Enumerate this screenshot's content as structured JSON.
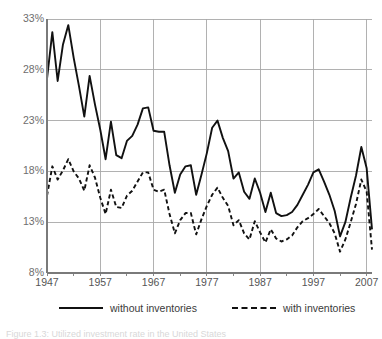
{
  "chart_data": {
    "type": "line",
    "title": "",
    "xlabel": "",
    "ylabel": "",
    "xlim": [
      1947,
      2008
    ],
    "ylim": [
      8,
      33
    ],
    "ytick_labels": [
      "33%",
      "28%",
      "23%",
      "18%",
      "13%",
      "8%"
    ],
    "ytick_values": [
      33,
      28,
      23,
      18,
      13,
      8
    ],
    "xtick_labels": [
      "1947",
      "1957",
      "1967",
      "1977",
      "1987",
      "1997",
      "2007"
    ],
    "xtick_values": [
      1947,
      1957,
      1967,
      1977,
      1987,
      1997,
      2007
    ],
    "grid": true,
    "legend_position": "bottom",
    "x": [
      1947,
      1948,
      1949,
      1950,
      1951,
      1952,
      1953,
      1954,
      1955,
      1956,
      1957,
      1958,
      1959,
      1960,
      1961,
      1962,
      1963,
      1964,
      1965,
      1966,
      1967,
      1968,
      1969,
      1970,
      1971,
      1972,
      1973,
      1974,
      1975,
      1976,
      1977,
      1978,
      1979,
      1980,
      1981,
      1982,
      1983,
      1984,
      1985,
      1986,
      1987,
      1988,
      1989,
      1990,
      1991,
      1992,
      1993,
      1994,
      1995,
      1996,
      1997,
      1998,
      1999,
      2000,
      2001,
      2002,
      2003,
      2004,
      2005,
      2006,
      2007,
      2008
    ],
    "series": [
      {
        "name": "without inventories",
        "style": "solid",
        "color": "#111111",
        "values": [
          27.1,
          31.7,
          26.9,
          30.5,
          32.4,
          29.2,
          26.4,
          23.4,
          27.4,
          24.6,
          22.1,
          19.2,
          22.9,
          19.6,
          19.3,
          21.0,
          21.5,
          22.6,
          24.2,
          24.3,
          22.0,
          21.9,
          21.9,
          18.6,
          15.9,
          17.7,
          18.5,
          18.6,
          15.7,
          17.7,
          19.8,
          22.3,
          23.0,
          21.3,
          20.0,
          17.3,
          17.9,
          16.0,
          15.3,
          17.3,
          15.9,
          14.0,
          15.9,
          13.9,
          13.6,
          13.7,
          14.0,
          14.7,
          15.7,
          16.7,
          17.9,
          18.2,
          17.0,
          15.7,
          14.1,
          11.6,
          13.0,
          15.4,
          17.6,
          20.4,
          18.3,
          12.3
        ]
      },
      {
        "name": "with inventories",
        "style": "dashed",
        "color": "#111111",
        "values": [
          15.6,
          18.5,
          17.2,
          18.1,
          19.2,
          18.0,
          17.3,
          16.1,
          18.6,
          17.4,
          15.4,
          13.8,
          16.2,
          14.5,
          14.4,
          15.6,
          16.1,
          17.0,
          17.9,
          17.9,
          16.2,
          16.0,
          16.2,
          13.8,
          11.9,
          13.2,
          13.9,
          13.9,
          11.8,
          13.3,
          14.6,
          15.7,
          16.4,
          15.4,
          14.6,
          12.7,
          13.2,
          11.9,
          11.3,
          13.1,
          12.0,
          11.0,
          12.3,
          11.4,
          11.1,
          11.3,
          11.7,
          12.5,
          13.1,
          13.4,
          13.8,
          14.3,
          13.6,
          12.9,
          11.9,
          10.1,
          11.3,
          13.0,
          14.8,
          17.2,
          16.0,
          10.3
        ]
      }
    ]
  },
  "axes": {
    "y_ticks": [
      "33%",
      "28%",
      "23%",
      "18%",
      "13%",
      "8%"
    ],
    "x_ticks": [
      "1947",
      "1957",
      "1967",
      "1977",
      "1987",
      "1997",
      "2007"
    ]
  },
  "legend": {
    "items": [
      {
        "label": "without inventories",
        "style": "solid"
      },
      {
        "label": "with inventories",
        "style": "dashed"
      }
    ]
  },
  "caption": {
    "text": "Figure 1.3: Utilized investment rate in the United States"
  }
}
